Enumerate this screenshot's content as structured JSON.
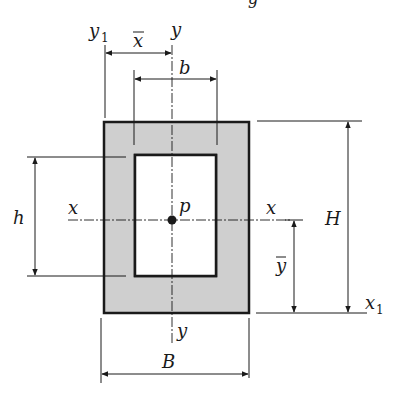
{
  "diagram": {
    "title_fragment": "g",
    "colors": {
      "fill": "#cfcfcf",
      "stroke": "#1a1a1a",
      "background": "#ffffff"
    },
    "labels": {
      "y1": "y",
      "y1_sub": "1",
      "x_bar": "x",
      "y_top": "y",
      "b": "b",
      "h": "h",
      "x_left": "x",
      "p": "p",
      "x_right": "x",
      "H": "H",
      "y_bar": "y",
      "x1": "x",
      "x1_sub": "1",
      "y_bottom": "y",
      "B": "B"
    },
    "dimensions": [
      "x̄",
      "b",
      "h",
      "H",
      "ȳ",
      "B"
    ],
    "axes": [
      "x",
      "y",
      "x1",
      "y1"
    ],
    "centroid": "p"
  }
}
